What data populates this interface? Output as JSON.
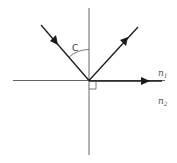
{
  "diagram": {
    "type": "total internal reflection / critical angle diagram",
    "labels": {
      "angle": "C",
      "medium_top": "n",
      "medium_top_sub": "1",
      "medium_bottom": "n",
      "medium_bottom_sub": "2"
    },
    "elements": {
      "normal_line": "vertical normal",
      "boundary_line": "horizontal interface",
      "incident_ray": "incident ray with arrow",
      "reflected_ray": "reflected ray with arrow",
      "refracted_ray": "refracted ray along boundary with arrow",
      "right_angle_marker": "right angle square"
    },
    "colors": {
      "line": "#444444",
      "ray": "#1a1a1a",
      "label": "#555555"
    }
  }
}
